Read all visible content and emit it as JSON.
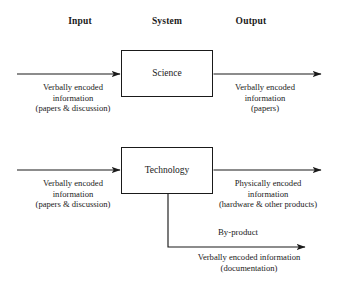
{
  "diagram": {
    "background_color": "#ffffff",
    "line_color": "#1a1a1a",
    "column_headers": [
      {
        "label": "Input",
        "x": 80,
        "y": 16
      },
      {
        "label": "System",
        "x": 167,
        "y": 16
      },
      {
        "label": "Output",
        "x": 251,
        "y": 16
      }
    ],
    "boxes": [
      {
        "id": "science",
        "label": "Science",
        "x": 121,
        "y": 50,
        "width": 92,
        "height": 47
      },
      {
        "id": "technology",
        "label": "Technology",
        "x": 121,
        "y": 147,
        "width": 92,
        "height": 47
      }
    ],
    "captions": [
      {
        "id": "science-input",
        "x": 73,
        "y": 82,
        "lines": [
          "Verbally encoded",
          "information",
          "(papers & discussion)"
        ]
      },
      {
        "id": "science-output",
        "x": 265,
        "y": 82,
        "lines": [
          "Verbally encoded",
          "information",
          "(papers)"
        ]
      },
      {
        "id": "technology-input",
        "x": 73,
        "y": 178,
        "lines": [
          "Verbally encoded",
          "information",
          "(papers & discussion)"
        ]
      },
      {
        "id": "technology-output",
        "x": 268,
        "y": 178,
        "lines": [
          "Physically encoded",
          "information",
          "(hardware & other products)"
        ]
      },
      {
        "id": "byproduct-output",
        "x": 249,
        "y": 252,
        "lines": [
          "Verbally encoded information",
          "(documentation)"
        ]
      }
    ],
    "inline_labels": [
      {
        "id": "by-product",
        "label": "By-product",
        "x": 238,
        "y": 228
      }
    ],
    "arrows": [
      {
        "id": "science-input-arrow",
        "x1": 17,
        "y1": 74,
        "x2": 121,
        "y2": 74
      },
      {
        "id": "science-output-arrow",
        "x1": 213,
        "y1": 74,
        "x2": 323,
        "y2": 74
      },
      {
        "id": "technology-input-arrow",
        "x1": 17,
        "y1": 170,
        "x2": 121,
        "y2": 170
      },
      {
        "id": "technology-output-arrow",
        "x1": 213,
        "y1": 170,
        "x2": 323,
        "y2": 170
      },
      {
        "id": "byproduct-arrow",
        "path": "M168,194 L168,247 L307,247"
      }
    ]
  }
}
